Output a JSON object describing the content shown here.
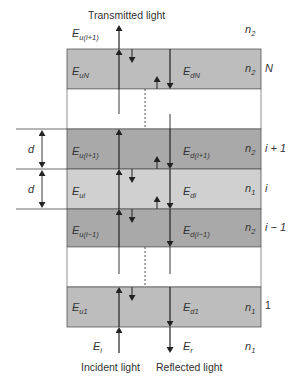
{
  "diagram": {
    "title_top": "Transmitted light",
    "bottom_left_label": "Incident light",
    "bottom_right_label": "Reflected light",
    "colors": {
      "layer_outer": "#bdbdbd",
      "layer_n2": "#a9a9a9",
      "layer_n1": "#d0d0d0",
      "gap": "#ffffff",
      "stroke": "#333333"
    },
    "top_medium": {
      "field": "E",
      "field_sub": "u(i+1)",
      "index": "n",
      "index_sub": "2"
    },
    "bottom_medium": {
      "incident": {
        "field": "E",
        "sub": "i"
      },
      "reflected": {
        "field": "E",
        "sub": "r"
      },
      "index": "n",
      "index_sub": "1"
    },
    "layers": [
      {
        "id": "N",
        "up": "E",
        "up_sub": "uN",
        "down": "E",
        "down_sub": "dN",
        "n": "n",
        "n_sub": "2",
        "label": "N"
      },
      {
        "id": "i+1",
        "up": "E",
        "up_sub": "u(i+1)",
        "down": "E",
        "down_sub": "d(i+1)",
        "n": "n",
        "n_sub": "2",
        "label": "i + 1"
      },
      {
        "id": "i",
        "up": "E",
        "up_sub": "ui",
        "down": "E",
        "down_sub": "di",
        "n": "n",
        "n_sub": "1",
        "label": "i"
      },
      {
        "id": "i-1",
        "up": "E",
        "up_sub": "u(i−1)",
        "down": "E",
        "down_sub": "d(i−1)",
        "n": "n",
        "n_sub": "2",
        "label": "i − 1"
      },
      {
        "id": "1",
        "up": "E",
        "up_sub": "u1",
        "down": "E",
        "down_sub": "d1",
        "n": "n",
        "n_sub": "1",
        "label": "1"
      }
    ],
    "thickness_label": "d"
  }
}
